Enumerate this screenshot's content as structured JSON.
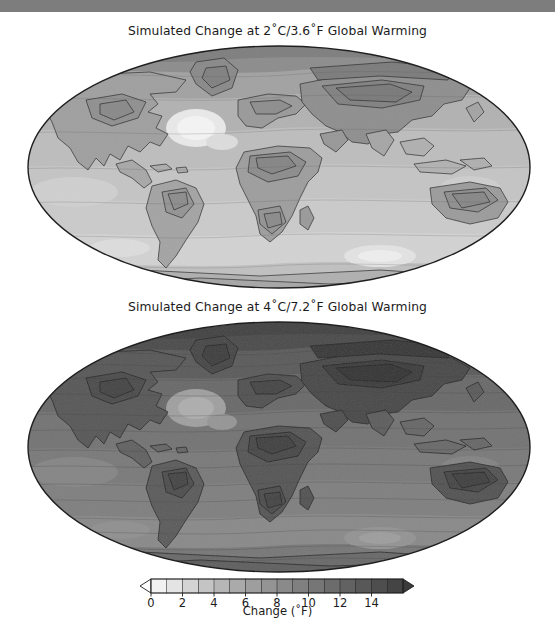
{
  "window": {
    "topbar_color": "#7d7d7d"
  },
  "figure": {
    "panels": [
      {
        "id": "panel-2c",
        "title": "Simulated Change at 2˚C/3.6˚F Global Warming",
        "scenario_c": 2,
        "scenario_f": 3.6
      },
      {
        "id": "panel-4c",
        "title": "Simulated Change at 4˚C/7.2˚F Global Warming",
        "scenario_c": 4,
        "scenario_f": 7.2
      }
    ]
  },
  "colorbar": {
    "label": "Change (˚F)",
    "ticks": [
      0,
      2,
      4,
      6,
      8,
      10,
      12,
      14
    ],
    "tick_labels": [
      "0",
      "2",
      "4",
      "6",
      "8",
      "10",
      "12",
      "14"
    ],
    "vmin": 0,
    "vmax": 16,
    "extend": "both",
    "swatches": [
      "#f2f2f2",
      "#e4e4e4",
      "#d4d4d4",
      "#c4c4c4",
      "#b6b6b6",
      "#aaaaaa",
      "#9e9e9e",
      "#949494",
      "#8a8a8a",
      "#808080",
      "#767676",
      "#6c6c6c",
      "#626262",
      "#585858",
      "#4e4e4e",
      "#444444"
    ],
    "under_color": "#ffffff",
    "over_color": "#3a3a3a"
  },
  "chart_data": {
    "type": "heatmap",
    "projection": "elliptical global (Mollweide-style)",
    "units": "˚F",
    "grid": false,
    "legend_position": "bottom",
    "colorbar_range": [
      0,
      16
    ],
    "panels": [
      {
        "name": "Simulated Change at 2˚C/3.6˚F Global Warming",
        "regions": [
          {
            "region": "Arctic / high northern latitudes",
            "value": 9
          },
          {
            "region": "Greenland",
            "value": 7
          },
          {
            "region": "Northern Canada & Alaska",
            "value": 7
          },
          {
            "region": "Contiguous United States",
            "value": 5
          },
          {
            "region": "North Atlantic warming hole",
            "value": 1
          },
          {
            "region": "Central America & Caribbean",
            "value": 3
          },
          {
            "region": "Amazon / northern South America",
            "value": 5
          },
          {
            "region": "Southern South America",
            "value": 3
          },
          {
            "region": "Northern Africa / Sahara",
            "value": 5
          },
          {
            "region": "Central & Southern Africa",
            "value": 5
          },
          {
            "region": "Europe",
            "value": 5
          },
          {
            "region": "Central Asia & Siberia",
            "value": 7
          },
          {
            "region": "South & Southeast Asia",
            "value": 3
          },
          {
            "region": "Australia",
            "value": 4
          },
          {
            "region": "Tropical oceans",
            "value": 3
          },
          {
            "region": "Southern Ocean",
            "value": 2
          },
          {
            "region": "Antarctica",
            "value": 3
          }
        ]
      },
      {
        "name": "Simulated Change at 4˚C/7.2˚F Global Warming",
        "regions": [
          {
            "region": "Arctic / high northern latitudes",
            "value": 15
          },
          {
            "region": "Greenland",
            "value": 13
          },
          {
            "region": "Northern Canada & Alaska",
            "value": 13
          },
          {
            "region": "Contiguous United States",
            "value": 10
          },
          {
            "region": "North Atlantic warming hole",
            "value": 4
          },
          {
            "region": "Central America & Caribbean",
            "value": 7
          },
          {
            "region": "Amazon / northern South America",
            "value": 10
          },
          {
            "region": "Southern South America",
            "value": 7
          },
          {
            "region": "Northern Africa / Sahara",
            "value": 10
          },
          {
            "region": "Central & Southern Africa",
            "value": 9
          },
          {
            "region": "Europe",
            "value": 10
          },
          {
            "region": "Central Asia & Siberia",
            "value": 13
          },
          {
            "region": "South & Southeast Asia",
            "value": 8
          },
          {
            "region": "Australia",
            "value": 9
          },
          {
            "region": "Tropical oceans",
            "value": 7
          },
          {
            "region": "Southern Ocean",
            "value": 5
          },
          {
            "region": "Antarctica",
            "value": 7
          }
        ]
      }
    ],
    "xlabel": "",
    "ylabel": ""
  }
}
